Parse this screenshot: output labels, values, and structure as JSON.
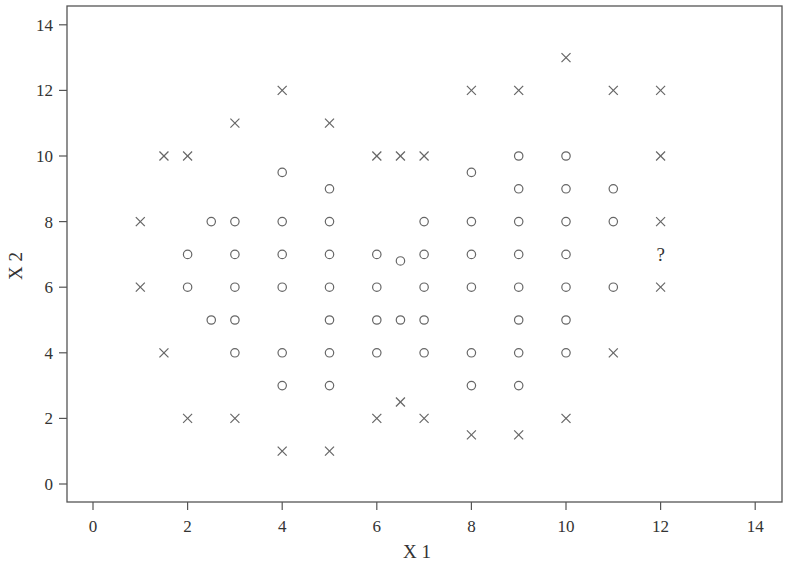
{
  "chart_data": {
    "type": "scatter",
    "title": "",
    "xlabel": "X 1",
    "ylabel": "X 2",
    "xlim": [
      -0.55,
      14.6
    ],
    "ylim": [
      -0.55,
      14.55
    ],
    "xticks": [
      0,
      2,
      4,
      6,
      8,
      10,
      12,
      14
    ],
    "yticks": [
      0,
      2,
      4,
      6,
      8,
      10,
      12,
      14
    ],
    "grid": false,
    "legend": null,
    "series": [
      {
        "name": "class-circle",
        "marker": "circle",
        "points": [
          [
            2,
            7
          ],
          [
            2,
            6
          ],
          [
            2.5,
            8
          ],
          [
            2.5,
            5
          ],
          [
            3,
            8
          ],
          [
            3,
            7
          ],
          [
            3,
            6
          ],
          [
            3,
            5
          ],
          [
            3,
            4
          ],
          [
            4,
            9.5
          ],
          [
            4,
            8
          ],
          [
            4,
            7
          ],
          [
            4,
            6
          ],
          [
            4,
            4
          ],
          [
            4,
            3
          ],
          [
            5,
            9
          ],
          [
            5,
            8
          ],
          [
            5,
            7
          ],
          [
            5,
            6
          ],
          [
            5,
            5
          ],
          [
            5,
            4
          ],
          [
            5,
            3
          ],
          [
            6,
            7
          ],
          [
            6,
            6
          ],
          [
            6,
            5
          ],
          [
            6,
            4
          ],
          [
            6.5,
            6.8
          ],
          [
            6.5,
            5
          ],
          [
            7,
            8
          ],
          [
            7,
            7
          ],
          [
            7,
            6
          ],
          [
            7,
            5
          ],
          [
            7,
            4
          ],
          [
            8,
            9.5
          ],
          [
            8,
            8
          ],
          [
            8,
            7
          ],
          [
            8,
            6
          ],
          [
            8,
            4
          ],
          [
            8,
            3
          ],
          [
            9,
            10
          ],
          [
            9,
            9
          ],
          [
            9,
            8
          ],
          [
            9,
            7
          ],
          [
            9,
            6
          ],
          [
            9,
            5
          ],
          [
            9,
            4
          ],
          [
            9,
            3
          ],
          [
            10,
            10
          ],
          [
            10,
            9
          ],
          [
            10,
            8
          ],
          [
            10,
            7
          ],
          [
            10,
            6
          ],
          [
            10,
            5
          ],
          [
            10,
            4
          ],
          [
            11,
            9
          ],
          [
            11,
            8
          ],
          [
            11,
            6
          ]
        ]
      },
      {
        "name": "class-cross",
        "marker": "x",
        "points": [
          [
            1,
            8
          ],
          [
            1,
            6
          ],
          [
            1.5,
            10
          ],
          [
            1.5,
            4
          ],
          [
            2,
            10
          ],
          [
            2,
            2
          ],
          [
            3,
            11
          ],
          [
            3,
            2
          ],
          [
            4,
            12
          ],
          [
            4,
            1
          ],
          [
            5,
            11
          ],
          [
            5,
            1
          ],
          [
            6,
            10
          ],
          [
            6,
            2
          ],
          [
            6.5,
            10
          ],
          [
            6.5,
            2.5
          ],
          [
            7,
            10
          ],
          [
            7,
            2
          ],
          [
            8,
            12
          ],
          [
            8,
            1.5
          ],
          [
            9,
            12
          ],
          [
            9,
            1.5
          ],
          [
            10,
            13
          ],
          [
            10,
            2
          ],
          [
            11,
            12
          ],
          [
            11,
            4
          ],
          [
            12,
            12
          ],
          [
            12,
            10
          ],
          [
            12,
            8
          ],
          [
            12,
            6
          ]
        ]
      }
    ],
    "annotations": [
      {
        "text": "?",
        "x": 12,
        "y": 7,
        "meaning": "unclassified query point"
      }
    ]
  },
  "layout": {
    "plot_box": {
      "left": 67,
      "top": 6,
      "right": 782,
      "bottom": 502
    },
    "x_map": {
      "origin_px": 93,
      "px_per_unit": 47.3
    },
    "y_map": {
      "origin_px": 484,
      "px_per_unit": 32.8
    },
    "colors": {
      "axis": "#555555",
      "marker": "#666666",
      "text": "#333333"
    }
  }
}
